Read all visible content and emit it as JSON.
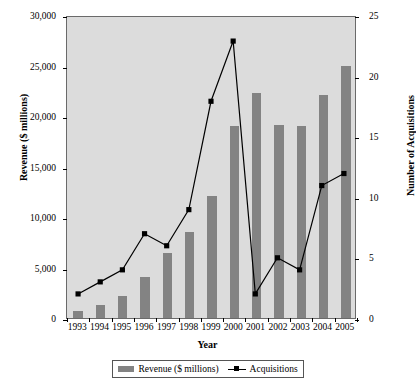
{
  "chart_data": {
    "type": "bar",
    "title": "",
    "xlabel": "Year",
    "ylabel": "Revenue ($ millions)",
    "y2label": "Number of Acquisitions",
    "categories": [
      "1993",
      "1994",
      "1995",
      "1996",
      "1997",
      "1998",
      "1999",
      "2000",
      "2001",
      "2002",
      "2003",
      "2004",
      "2005"
    ],
    "ylim": [
      0,
      30000
    ],
    "y2lim": [
      0,
      25
    ],
    "yticks": [
      "0",
      "5,000",
      "10,000",
      "15,000",
      "20,000",
      "25,000",
      "30,000"
    ],
    "ytick_values": [
      0,
      5000,
      10000,
      15000,
      20000,
      25000,
      30000
    ],
    "y2ticks": [
      "0",
      "5",
      "10",
      "15",
      "20",
      "25"
    ],
    "y2tick_values": [
      0,
      5,
      10,
      15,
      20,
      25
    ],
    "grid": false,
    "legend_position": "bottom",
    "series": [
      {
        "name": "Revenue ($ millions)",
        "kind": "bar",
        "axis": "left",
        "color": "#838383",
        "values": [
          700,
          1300,
          2200,
          4100,
          6400,
          8500,
          12100,
          19000,
          22300,
          19100,
          19000,
          22100,
          25000
        ]
      },
      {
        "name": "Acquisitions",
        "kind": "line",
        "axis": "right",
        "color": "#000000",
        "marker": "square",
        "values": [
          2,
          3,
          4,
          7,
          6,
          9,
          18,
          23,
          2,
          5,
          4,
          11,
          12
        ]
      }
    ]
  },
  "legend": {
    "items": [
      {
        "label": "Revenue ($ millions)",
        "type": "bar-swatch"
      },
      {
        "label": "Acquisitions",
        "type": "line-marker-swatch"
      }
    ]
  },
  "colors": {
    "bar": "#838383",
    "line": "#000000",
    "plot_background": "#dcdcdc",
    "page_background": "#ffffff",
    "axis": "#000000"
  }
}
